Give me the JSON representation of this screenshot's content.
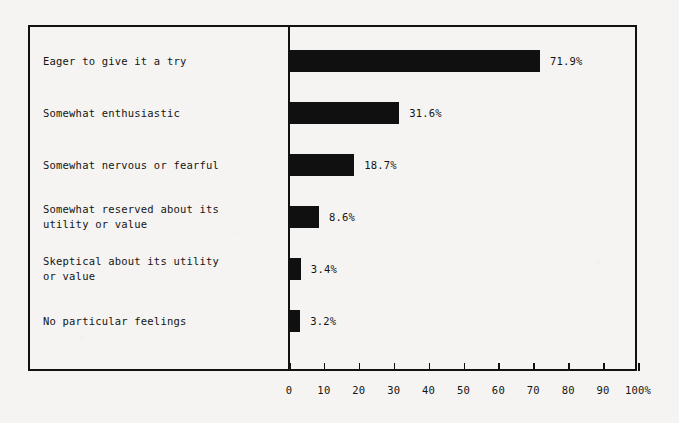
{
  "chart_data": {
    "type": "bar",
    "orientation": "horizontal",
    "title": "",
    "subtitle": "",
    "xlabel": "",
    "ylabel": "",
    "xlim": [
      0,
      100
    ],
    "grid": false,
    "legend": null,
    "categories": [
      "Eager to give it a try",
      "Somewhat enthusiastic",
      "Somewhat nervous or fearful",
      "Somewhat reserved about its\nutility or value",
      "Skeptical about its utility\nor value",
      "No particular feelings"
    ],
    "values": [
      71.9,
      31.6,
      18.7,
      8.6,
      3.4,
      3.2
    ],
    "value_labels": [
      "71.9%",
      "31.6%",
      "18.7%",
      "8.6%",
      "3.4%",
      "3.2%"
    ],
    "xticks": [
      0,
      10,
      20,
      30,
      40,
      50,
      60,
      70,
      80,
      90,
      100
    ],
    "xtick_labels": [
      "0",
      "10",
      "20",
      "30",
      "40",
      "50",
      "60",
      "70",
      "80",
      "90",
      "100%"
    ],
    "bar_color": "#101010",
    "axis_color": "#111111",
    "background_color": "#f5f4f2"
  },
  "rows": [
    {
      "label": "Eager to give it a try",
      "value": 71.9,
      "value_label": "71.9%",
      "lines": 1
    },
    {
      "label": "Somewhat enthusiastic",
      "value": 31.6,
      "value_label": "31.6%",
      "lines": 1
    },
    {
      "label": "Somewhat nervous or fearful",
      "value": 18.7,
      "value_label": "18.7%",
      "lines": 1
    },
    {
      "label": "Somewhat reserved about its\nutility or value",
      "value": 8.6,
      "value_label": "8.6%",
      "lines": 2
    },
    {
      "label": "Skeptical about its utility\nor value",
      "value": 3.4,
      "value_label": "3.4%",
      "lines": 2
    },
    {
      "label": "No particular feelings",
      "value": 3.2,
      "value_label": "3.2%",
      "lines": 1
    }
  ]
}
